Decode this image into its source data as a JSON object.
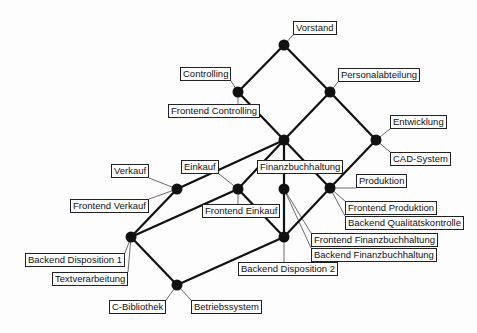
{
  "nodes": [
    {
      "id": "n1",
      "x": 284,
      "y": 45
    },
    {
      "id": "n2",
      "x": 238,
      "y": 92
    },
    {
      "id": "n3",
      "x": 330,
      "y": 92
    },
    {
      "id": "n4",
      "x": 284,
      "y": 140
    },
    {
      "id": "n5",
      "x": 376,
      "y": 140
    },
    {
      "id": "n6",
      "x": 177,
      "y": 189
    },
    {
      "id": "n7",
      "x": 238,
      "y": 189
    },
    {
      "id": "n8",
      "x": 284,
      "y": 189
    },
    {
      "id": "n9",
      "x": 330,
      "y": 188
    },
    {
      "id": "n10",
      "x": 131,
      "y": 237
    },
    {
      "id": "n11",
      "x": 284,
      "y": 237
    },
    {
      "id": "n12",
      "x": 177,
      "y": 285
    }
  ],
  "edges": [
    [
      "n1",
      "n2"
    ],
    [
      "n1",
      "n3"
    ],
    [
      "n2",
      "n4"
    ],
    [
      "n3",
      "n4"
    ],
    [
      "n3",
      "n5"
    ],
    [
      "n4",
      "n6"
    ],
    [
      "n4",
      "n7"
    ],
    [
      "n4",
      "n8"
    ],
    [
      "n4",
      "n9"
    ],
    [
      "n5",
      "n9"
    ],
    [
      "n6",
      "n10"
    ],
    [
      "n7",
      "n10"
    ],
    [
      "n7",
      "n11"
    ],
    [
      "n8",
      "n11"
    ],
    [
      "n9",
      "n11"
    ],
    [
      "n10",
      "n12"
    ],
    [
      "n11",
      "n12"
    ]
  ],
  "labels": [
    {
      "text": "Vorstand",
      "x": 293,
      "y": 21,
      "node": "n1"
    },
    {
      "text": "Controlling",
      "x": 180,
      "y": 67,
      "node": "n2"
    },
    {
      "text": "Frontend Controlling",
      "x": 168,
      "y": 104,
      "node": "n2"
    },
    {
      "text": "Personalabteilung",
      "x": 338,
      "y": 68,
      "node": "n3"
    },
    {
      "text": "Entwicklung",
      "x": 390,
      "y": 115,
      "node": "n5"
    },
    {
      "text": "CAD-System",
      "x": 390,
      "y": 152,
      "node": "n5"
    },
    {
      "text": "Verkauf",
      "x": 111,
      "y": 164,
      "node": "n6"
    },
    {
      "text": "Einkauf",
      "x": 181,
      "y": 160,
      "node": "n7"
    },
    {
      "text": "Finanzbuchhaltung",
      "x": 257,
      "y": 160,
      "node": "n8"
    },
    {
      "text": "Produktion",
      "x": 356,
      "y": 174,
      "node": "n9"
    },
    {
      "text": "Frontend Verkauf",
      "x": 70,
      "y": 199,
      "node": "n6"
    },
    {
      "text": "Frontend Einkauf",
      "x": 202,
      "y": 204,
      "node": "n7"
    },
    {
      "text": "Frontend Produktion",
      "x": 345,
      "y": 201,
      "node": "n9"
    },
    {
      "text": "Backend Qualitätskontrolle",
      "x": 345,
      "y": 216,
      "node": "n9"
    },
    {
      "text": "Frontend Finanzbuchhaltung",
      "x": 311,
      "y": 233,
      "node": "n8"
    },
    {
      "text": "Backend Finanzbuchhaltung",
      "x": 311,
      "y": 248,
      "node": "n8"
    },
    {
      "text": "Backend Disposition 2",
      "x": 238,
      "y": 262,
      "node": "n11"
    },
    {
      "text": "Backend Disposition 1",
      "x": 25,
      "y": 253,
      "node": "n10"
    },
    {
      "text": "Textverarbeitung",
      "x": 52,
      "y": 272,
      "node": "n10"
    },
    {
      "text": "C-Bibliothek",
      "x": 109,
      "y": 300,
      "node": "n12"
    },
    {
      "text": "Betriebssystem",
      "x": 191,
      "y": 300,
      "node": "n12"
    }
  ],
  "colors": {
    "edge": "#111111",
    "node": "#111111",
    "leader": "#444444"
  }
}
